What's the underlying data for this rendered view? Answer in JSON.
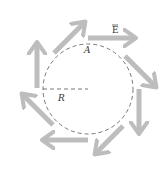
{
  "diagram": {
    "labels": {
      "field": "E",
      "point": "A",
      "radius": "R"
    },
    "colors": {
      "arrow": "#bdbdbd",
      "circle": "#555555",
      "text": "#333333"
    },
    "circle": {
      "cx": 88,
      "cy": 89,
      "r": 45,
      "style": "dashed"
    },
    "arrows": {
      "count": 8,
      "direction": "clockwise"
    }
  }
}
